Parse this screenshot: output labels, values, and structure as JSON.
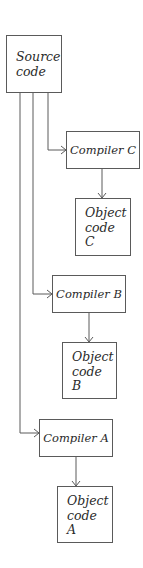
{
  "diagram": {
    "source": {
      "label": "Source\ncode"
    },
    "compilers": [
      {
        "id": "C",
        "label": "Compiler C",
        "output": "Object\ncode\nC"
      },
      {
        "id": "B",
        "label": "Compiler B",
        "output": "Object\ncode\nB"
      },
      {
        "id": "A",
        "label": "Compiler A",
        "output": "Object\ncode\nA"
      }
    ],
    "colors": {
      "stroke": "#5a5a5a",
      "text": "#2a2a2a",
      "background": "#ffffff"
    }
  }
}
